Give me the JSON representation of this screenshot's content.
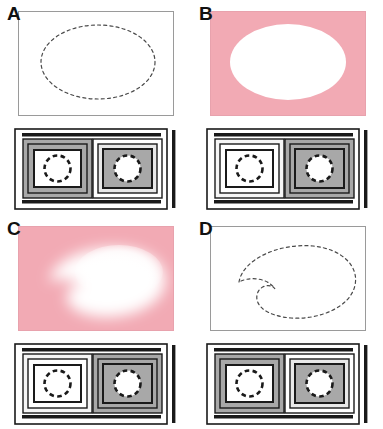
{
  "figure": {
    "type": "micrograph-schematic-grid",
    "rows": 2,
    "columns": 2,
    "colors": {
      "stain_pink": "#f2aab4",
      "unstained_white": "#ffffff",
      "schematic_gray": "#a8a8a8",
      "schematic_light_gray": "#e9e9e9",
      "schematic_black": "#1a1a1a"
    }
  },
  "panels": [
    {
      "id": "A",
      "label": "A",
      "micrograph": {
        "background": "white",
        "background_color": "#ffffff",
        "region_style": "dashed-outline",
        "region_shape": "ellipse",
        "region_fill": "none",
        "stained": false
      },
      "schematic": {
        "cells": [
          {
            "position": "left",
            "outer_fill": "gray",
            "inner_fill": "white",
            "circle_fill": "white",
            "circle_outline": "dashed"
          },
          {
            "position": "right",
            "outer_fill": "white",
            "inner_fill": "gray",
            "circle_fill": "white",
            "circle_outline": "dashed"
          }
        ]
      }
    },
    {
      "id": "B",
      "label": "B",
      "micrograph": {
        "background": "pink",
        "background_color": "#f2aab4",
        "region_style": "solid-sharp",
        "region_shape": "ellipse",
        "region_fill": "white",
        "stained": true
      },
      "schematic": {
        "cells": [
          {
            "position": "left",
            "outer_fill": "white",
            "inner_fill": "white",
            "circle_fill": "white",
            "circle_outline": "dashed"
          },
          {
            "position": "right",
            "outer_fill": "gray",
            "inner_fill": "gray",
            "circle_fill": "white",
            "circle_outline": "dashed"
          }
        ]
      }
    },
    {
      "id": "C",
      "label": "C",
      "micrograph": {
        "background": "pink",
        "background_color": "#f2aab4",
        "region_style": "diffuse-blurred",
        "region_shape": "comma-kidney",
        "region_fill": "white",
        "stained": true
      },
      "schematic": {
        "cells": [
          {
            "position": "left",
            "outer_fill": "white",
            "inner_fill": "white",
            "circle_fill": "white",
            "circle_outline": "dashed"
          },
          {
            "position": "right",
            "outer_fill": "gray",
            "inner_fill": "gray",
            "circle_fill": "white",
            "circle_outline": "dashed"
          }
        ]
      }
    },
    {
      "id": "D",
      "label": "D",
      "micrograph": {
        "background": "white",
        "background_color": "#ffffff",
        "region_style": "dashed-outline",
        "region_shape": "comma-kidney",
        "region_fill": "none",
        "stained": false
      },
      "schematic": {
        "cells": [
          {
            "position": "left",
            "outer_fill": "gray",
            "inner_fill": "white",
            "circle_fill": "white",
            "circle_outline": "dashed"
          },
          {
            "position": "right",
            "outer_fill": "white",
            "inner_fill": "gray",
            "circle_fill": "white",
            "circle_outline": "dashed"
          }
        ]
      }
    }
  ]
}
